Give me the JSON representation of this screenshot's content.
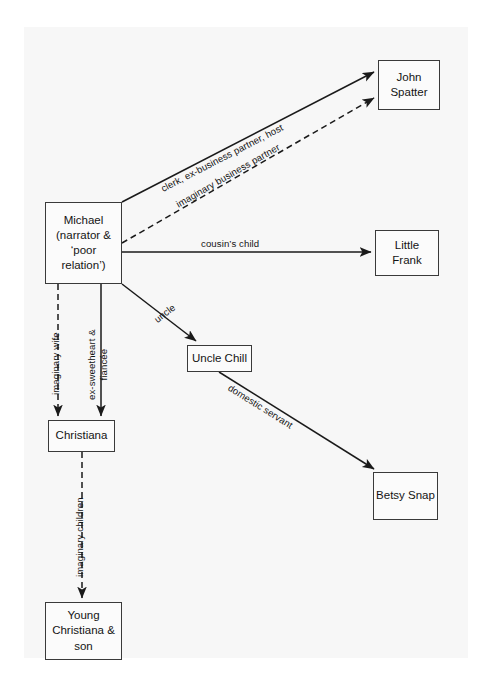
{
  "diagram": {
    "type": "node-link-graph",
    "background_color": "#f7f7f7",
    "line_color": "#1a1a1a",
    "nodes": [
      {
        "id": "michael",
        "label": "Michael\n(narrator &\n‘poor\nrelation’)"
      },
      {
        "id": "spatter",
        "label": "John\nSpatter"
      },
      {
        "id": "frank",
        "label": "Little\nFrank"
      },
      {
        "id": "chill",
        "label": "Uncle Chill"
      },
      {
        "id": "betsy",
        "label": "Betsy Snap"
      },
      {
        "id": "christiana",
        "label": "Christiana"
      },
      {
        "id": "young",
        "label": "Young\nChristiana &\nson"
      }
    ],
    "edges": [
      {
        "id": "e1",
        "from": "michael",
        "to": "spatter",
        "label": "clerk, ex-business partner, host",
        "style": "solid"
      },
      {
        "id": "e2",
        "from": "michael",
        "to": "spatter",
        "label": "imaginary business partner",
        "style": "dashed"
      },
      {
        "id": "e3",
        "from": "michael",
        "to": "frank",
        "label": "cousin’s child",
        "style": "solid"
      },
      {
        "id": "e4",
        "from": "michael",
        "to": "chill",
        "label": "uncle",
        "style": "solid"
      },
      {
        "id": "e5",
        "from": "michael",
        "to": "christiana",
        "label": "imaginary wife",
        "style": "dashed"
      },
      {
        "id": "e6",
        "from": "michael",
        "to": "christiana",
        "label": "ex-sweetheart &\nfiancée",
        "style": "solid"
      },
      {
        "id": "e7",
        "from": "chill",
        "to": "betsy",
        "label": "domestic servant",
        "style": "solid"
      },
      {
        "id": "e8",
        "from": "christiana",
        "to": "young",
        "label": "imaginary children",
        "style": "dashed"
      }
    ]
  }
}
